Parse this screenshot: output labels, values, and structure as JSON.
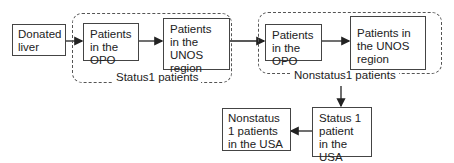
{
  "diagram": {
    "nodes": {
      "donated_liver": "Donated liver",
      "status1_opo": "Patients in the OPO",
      "status1_unos": "Patients in the UNOS region",
      "nonstatus1_opo": "Patients in the OPO",
      "nonstatus1_unos": "Patients in the UNOS region",
      "status1_usa": "Status 1 patient in the USA",
      "nonstatus1_usa": "Nonstatus 1 patients in the USA"
    },
    "groups": {
      "status1": "Status1 patients",
      "nonstatus1": "Nonstatus1 patients"
    },
    "edges": [
      {
        "from": "donated_liver",
        "to": "status1_opo"
      },
      {
        "from": "status1_opo",
        "to": "status1_unos"
      },
      {
        "from": "status1_unos",
        "to": "nonstatus1_opo"
      },
      {
        "from": "nonstatus1_opo",
        "to": "nonstatus1_unos"
      },
      {
        "from": "nonstatus1_group",
        "to": "status1_usa"
      },
      {
        "from": "status1_usa",
        "to": "nonstatus1_usa"
      }
    ]
  }
}
